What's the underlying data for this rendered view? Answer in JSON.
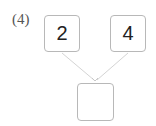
{
  "problem": {
    "label": "(4)",
    "top_left_value": "2",
    "top_right_value": "4",
    "answer_value": ""
  },
  "colors": {
    "box_border": "#b8b8b8",
    "arrow": "#d0d0d0",
    "text": "#222222"
  }
}
